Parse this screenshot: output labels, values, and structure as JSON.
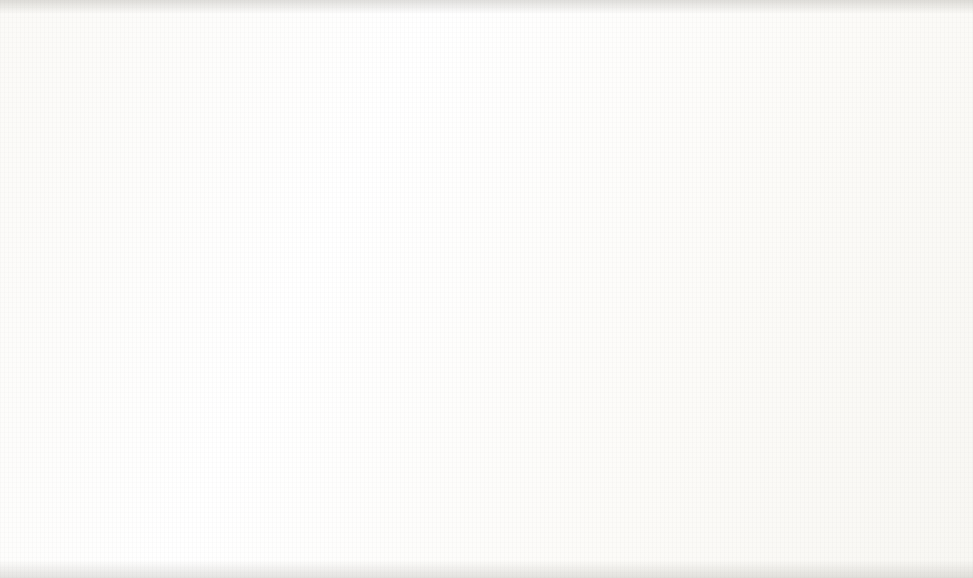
{
  "chart_data": {
    "type": "line",
    "title": "Worry",
    "xlabel": "",
    "ylabel": "Means",
    "categories": [
      "Training 1",
      "Training 2",
      "Practice 1",
      "Practice 2"
    ],
    "series": [
      {
        "name": "Control",
        "marker": "circle",
        "linestyle": "solid",
        "values": [
          8.15,
          6.8,
          8.48,
          8.55
        ]
      },
      {
        "name": "Massed Exposure",
        "marker": "triangle",
        "linestyle": "dashed",
        "values": [
          8.66,
          7.97,
          9.2,
          10.37
        ]
      },
      {
        "name": "Highlighting",
        "marker": "square",
        "linestyle": "solid",
        "values": [
          11.22,
          11.75,
          10.93,
          10.89
        ]
      }
    ],
    "ylim": [
      6.0,
      13.0
    ],
    "ytick_labels": [
      "13.00",
      "12.00",
      "11.00",
      "10.00",
      "9.00",
      "8.00",
      "7.00",
      "6.00"
    ],
    "ytick_values": [
      13,
      12,
      11,
      10,
      9,
      8,
      7,
      6
    ],
    "grid": false,
    "legend_position": "bottom",
    "line_color": "#111111"
  },
  "legend": {
    "entries": [
      {
        "label": "Control",
        "icon": "circle-marker-solid-line-icon"
      },
      {
        "label": "Massed Exposure",
        "icon": "triangle-marker-dashed-line-icon"
      },
      {
        "label": "Highlighting",
        "icon": "square-marker-solid-line-icon"
      }
    ]
  },
  "bleed_through": {
    "note": "faint mirrored text showing through from reverse page",
    "fragments": [
      {
        "text": "Stress and",
        "x": 700,
        "y": 148,
        "size": 19
      },
      {
        "text": "Perceived",
        "x": 545,
        "y": 148,
        "size": 19
      },
      {
        "text": "Involve",
        "x": 855,
        "y": 148,
        "size": 19
      },
      {
        "text": "Control",
        "x": 700,
        "y": 172,
        "size": 19
      },
      {
        "text": "Tension",
        "x": 545,
        "y": 172,
        "size": 19
      },
      {
        "text": "Prepared",
        "x": 855,
        "y": 172,
        "size": 19
      },
      {
        "text": "ment",
        "x": 440,
        "y": 226,
        "size": 19
      },
      {
        "text": "Relationships",
        "x": 560,
        "y": 226,
        "size": 19
      },
      {
        "text": "Obligation",
        "x": 720,
        "y": 226,
        "size": 19
      },
      {
        "text": "Interpersonal",
        "x": 120,
        "y": 300,
        "size": 19
      },
      {
        "text": "related standards",
        "x": 470,
        "y": 300,
        "size": 19
      },
      {
        "text": "Sensitive to IMI scales",
        "x": 30,
        "y": 405,
        "size": 19
      },
      {
        "text": "were correlated with the legend",
        "x": 430,
        "y": 405,
        "size": 19
      },
      {
        "text": "scale. Test 4 reports rule that the IMI ratings",
        "x": 60,
        "y": 432,
        "size": 19
      },
      {
        "text": "a significantly positive correlation between",
        "x": 60,
        "y": 463,
        "size": 19
      },
      {
        "text": "scales and IPSQ sequence scores. All were",
        "x": 40,
        "y": 492,
        "size": 19
      },
      {
        "text": "of the interpersonal scales and IPSQ",
        "x": 40,
        "y": 520,
        "size": 19
      },
      {
        "text": "ratings of the",
        "x": 30,
        "y": 550,
        "size": 19
      }
    ]
  }
}
